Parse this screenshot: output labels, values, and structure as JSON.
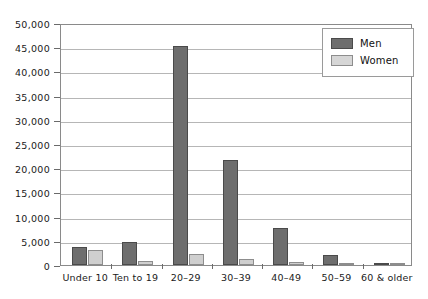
{
  "top_text_remnant": "                                                                                                                          ",
  "legend": {
    "position": "top-right",
    "entries": [
      {
        "label": "Men",
        "color": "#6e6e6e",
        "swatch": "men-swatch"
      },
      {
        "label": "Women",
        "color": "#d6d6d6",
        "swatch": "women-swatch"
      }
    ]
  },
  "axis": {
    "y_tick_labels": [
      "50,000",
      "45,000",
      "40,000",
      "35,000",
      "30,000",
      "25,000",
      "20,000",
      "15,000",
      "10,000",
      "5,000",
      "0"
    ],
    "x_tick_labels": [
      "Under 10",
      "Ten to 19",
      "20–29",
      "30–39",
      "40–49",
      "50–59",
      "60 & older"
    ]
  },
  "chart_data": {
    "type": "bar",
    "title": "",
    "subtitle": "",
    "xlabel": "",
    "ylabel": "",
    "categories": [
      "Under 10",
      "Ten to 19",
      "20–29",
      "30–39",
      "40–49",
      "50–59",
      "60 & older"
    ],
    "series": [
      {
        "name": "Men",
        "color": "#6e6e6e",
        "values": [
          3700,
          4800,
          45200,
          21800,
          7600,
          2000,
          500
        ]
      },
      {
        "name": "Women",
        "color": "#d6d6d6",
        "values": [
          3100,
          900,
          2300,
          1300,
          700,
          400,
          200
        ]
      }
    ],
    "ylim": [
      0,
      50000
    ],
    "ytick_step": 5000,
    "yticks": [
      0,
      5000,
      10000,
      15000,
      20000,
      25000,
      30000,
      35000,
      40000,
      45000,
      50000
    ],
    "grid": true,
    "grid_axis": "y",
    "legend": true,
    "legend_position": "upper right",
    "bar_group_mode": "grouped"
  }
}
